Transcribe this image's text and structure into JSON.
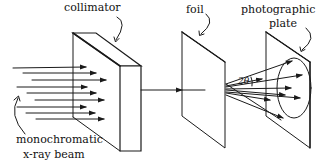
{
  "diagram": {
    "labels": {
      "collimator": "collimator",
      "foil": "foil",
      "plate_line1": "photographic",
      "plate_line2": "plate",
      "beam_line1": "monochromatic",
      "beam_line2": "x-ray beam"
    },
    "angle_symbol": "2θ",
    "components": [
      {
        "name": "x-ray beam",
        "description": "parallel incoming rays with arrowheads"
      },
      {
        "name": "collimator",
        "description": "thick slab block"
      },
      {
        "name": "foil",
        "description": "thin sheet target"
      },
      {
        "name": "photographic plate",
        "description": "sheet with diffraction cone ring"
      }
    ],
    "colors": {
      "line": "#1a1a1a",
      "background": "#ffffff"
    }
  }
}
